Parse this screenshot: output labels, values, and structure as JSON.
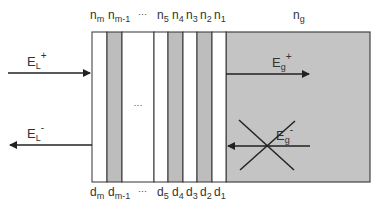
{
  "diagram": {
    "colors": {
      "layer_light": "#ffffff",
      "layer_dark": "#bdbdbd",
      "substrate": "#c4c4c4",
      "stroke": "#333333"
    },
    "top_labels": [
      {
        "base": "n",
        "sub": "m"
      },
      {
        "base": "n",
        "sub": "m-1"
      },
      {
        "base": "···",
        "sub": ""
      },
      {
        "base": "n",
        "sub": "5"
      },
      {
        "base": "n",
        "sub": "4"
      },
      {
        "base": "n",
        "sub": "3"
      },
      {
        "base": "n",
        "sub": "2"
      },
      {
        "base": "n",
        "sub": "1"
      }
    ],
    "bottom_labels": [
      {
        "base": "d",
        "sub": "m"
      },
      {
        "base": "d",
        "sub": "m-1"
      },
      {
        "base": "···",
        "sub": ""
      },
      {
        "base": "d",
        "sub": "5"
      },
      {
        "base": "d",
        "sub": "4"
      },
      {
        "base": "d",
        "sub": "3"
      },
      {
        "base": "d",
        "sub": "2"
      },
      {
        "base": "d",
        "sub": "1"
      }
    ],
    "substrate_label": {
      "base": "n",
      "sub": "g"
    },
    "middle_ellipsis": "···",
    "arrows": {
      "incident": {
        "base": "E",
        "sub": "L",
        "sup": "+"
      },
      "reflected": {
        "base": "E",
        "sub": "L",
        "sup": "-"
      },
      "transmitted": {
        "base": "E",
        "sub": "g",
        "sup": "+"
      },
      "substrate_backward": {
        "base": "E",
        "sub": "g",
        "sup": "-",
        "crossed_out": true
      }
    }
  }
}
